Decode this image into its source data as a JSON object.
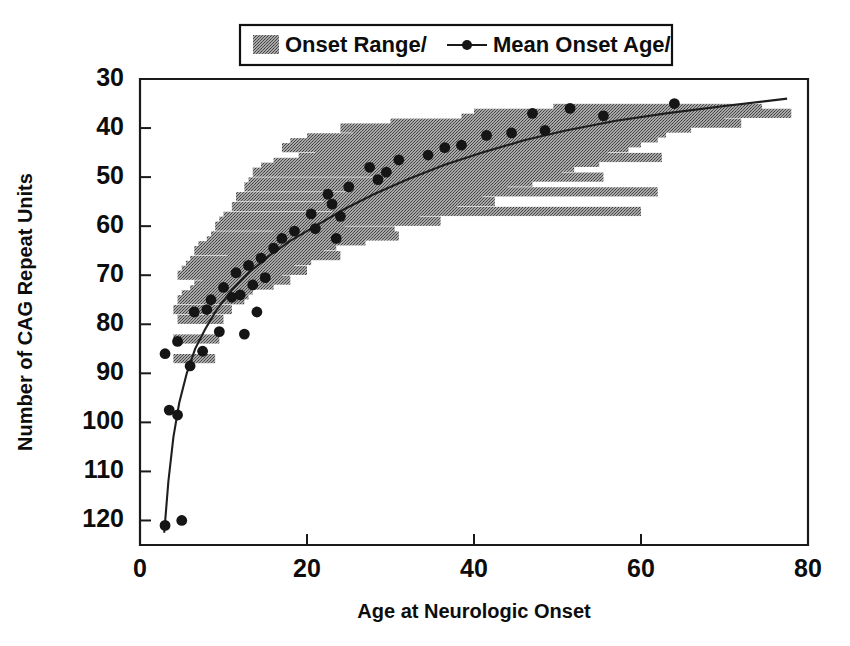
{
  "figure": {
    "legend": {
      "position": "top-center",
      "entries": [
        {
          "label": "Onset Range/",
          "marker": "gray-bar-swatch"
        },
        {
          "label": "Mean Onset Age/",
          "marker": "line-with-dot"
        }
      ]
    }
  },
  "chart_data": {
    "type": "scatter",
    "title": "",
    "subtitle": "",
    "xlabel": "Age at Neurologic Onset",
    "ylabel": "Number of CAG Repeat Units",
    "xlim": [
      0,
      80
    ],
    "ylim": [
      30,
      125
    ],
    "y_axis_inverted": true,
    "grid": false,
    "xticks": [
      0,
      20,
      40,
      60,
      80
    ],
    "xticklabels": [
      "0",
      "20",
      "40",
      "60",
      "80"
    ],
    "yticks": [
      30,
      40,
      50,
      60,
      70,
      80,
      90,
      100,
      110,
      120
    ],
    "yticklabels": [
      "30",
      "40",
      "50",
      "60",
      "70",
      "80",
      "90",
      "100",
      "110",
      "120"
    ],
    "legend_entries": [
      "Onset Range/",
      "Mean Onset Age/"
    ],
    "series": [
      {
        "name": "Onset Range/",
        "type": "hbar-range",
        "color": "#909090",
        "note": "Horizontal gray bars spanning min-to-max age of onset at each CAG repeat length",
        "ranges": [
          {
            "cag": 36,
            "xmin": 49.5,
            "xmax": 74.5
          },
          {
            "cag": 37,
            "xmin": 40.0,
            "xmax": 78.0
          },
          {
            "cag": 38,
            "xmin": 38.5,
            "xmax": 70.0
          },
          {
            "cag": 39,
            "xmin": 30.0,
            "xmax": 72.0
          },
          {
            "cag": 40,
            "xmin": 24.0,
            "xmax": 66.0
          },
          {
            "cag": 41,
            "xmin": 25.5,
            "xmax": 63.0
          },
          {
            "cag": 42,
            "xmin": 20.0,
            "xmax": 62.0
          },
          {
            "cag": 43,
            "xmin": 18.0,
            "xmax": 60.0
          },
          {
            "cag": 44,
            "xmin": 17.0,
            "xmax": 58.5
          },
          {
            "cag": 45,
            "xmin": 21.0,
            "xmax": 56.0
          },
          {
            "cag": 46,
            "xmin": 19.0,
            "xmax": 62.5
          },
          {
            "cag": 47,
            "xmin": 16.0,
            "xmax": 55.0
          },
          {
            "cag": 48,
            "xmin": 14.5,
            "xmax": 52.0
          },
          {
            "cag": 49,
            "xmin": 13.5,
            "xmax": 50.5
          },
          {
            "cag": 50,
            "xmin": 28.0,
            "xmax": 55.5
          },
          {
            "cag": 51,
            "xmin": 13.0,
            "xmax": 47.0
          },
          {
            "cag": 52,
            "xmin": 12.5,
            "xmax": 44.0
          },
          {
            "cag": 53,
            "xmin": 25.0,
            "xmax": 62.0
          },
          {
            "cag": 54,
            "xmin": 11.5,
            "xmax": 41.0
          },
          {
            "cag": 55,
            "xmin": 22.0,
            "xmax": 42.5
          },
          {
            "cag": 56,
            "xmin": 11.0,
            "xmax": 38.0
          },
          {
            "cag": 57,
            "xmin": 23.0,
            "xmax": 60.0
          },
          {
            "cag": 58,
            "xmin": 10.0,
            "xmax": 33.5
          },
          {
            "cag": 59,
            "xmin": 9.5,
            "xmax": 36.0
          },
          {
            "cag": 60,
            "xmin": 9.0,
            "xmax": 24.5
          },
          {
            "cag": 61,
            "xmin": 16.0,
            "xmax": 30.5
          },
          {
            "cag": 62,
            "xmin": 8.5,
            "xmax": 31.0
          },
          {
            "cag": 63,
            "xmin": 8.0,
            "xmax": 27.0
          },
          {
            "cag": 64,
            "xmin": 7.0,
            "xmax": 23.5
          },
          {
            "cag": 65,
            "xmin": 6.5,
            "xmax": 22.0
          },
          {
            "cag": 66,
            "xmin": 10.5,
            "xmax": 24.0
          },
          {
            "cag": 67,
            "xmin": 6.0,
            "xmax": 20.5
          },
          {
            "cag": 68,
            "xmin": 5.5,
            "xmax": 18.5
          },
          {
            "cag": 69,
            "xmin": 5.0,
            "xmax": 20.0
          },
          {
            "cag": 70,
            "xmin": 4.5,
            "xmax": 17.0
          },
          {
            "cag": 71,
            "xmin": 7.5,
            "xmax": 18.0
          },
          {
            "cag": 72,
            "xmin": 6.5,
            "xmax": 16.0
          },
          {
            "cag": 73,
            "xmin": 6.0,
            "xmax": 13.5
          },
          {
            "cag": 74,
            "xmin": 5.0,
            "xmax": 13.0
          },
          {
            "cag": 75,
            "xmin": 4.5,
            "xmax": 12.5
          },
          {
            "cag": 77,
            "xmin": 4.0,
            "xmax": 11.0
          },
          {
            "cag": 79,
            "xmin": 4.5,
            "xmax": 10.0
          },
          {
            "cag": 83,
            "xmin": 4.0,
            "xmax": 9.5
          },
          {
            "cag": 87,
            "xmin": 4.0,
            "xmax": 9.0
          }
        ]
      },
      {
        "name": "Mean Onset Age/",
        "type": "scatter-points",
        "color": "#151515",
        "points": [
          {
            "x": 64.0,
            "y": 35.0
          },
          {
            "x": 51.5,
            "y": 36.0
          },
          {
            "x": 55.5,
            "y": 37.5
          },
          {
            "x": 47.0,
            "y": 37.0
          },
          {
            "x": 48.5,
            "y": 40.5
          },
          {
            "x": 44.5,
            "y": 41.0
          },
          {
            "x": 41.5,
            "y": 41.5
          },
          {
            "x": 38.5,
            "y": 43.5
          },
          {
            "x": 36.5,
            "y": 44.0
          },
          {
            "x": 34.5,
            "y": 45.5
          },
          {
            "x": 31.0,
            "y": 46.5
          },
          {
            "x": 29.5,
            "y": 49.0
          },
          {
            "x": 28.5,
            "y": 50.5
          },
          {
            "x": 27.5,
            "y": 48.0
          },
          {
            "x": 25.0,
            "y": 52.0
          },
          {
            "x": 22.5,
            "y": 53.5
          },
          {
            "x": 23.0,
            "y": 55.5
          },
          {
            "x": 20.5,
            "y": 57.5
          },
          {
            "x": 24.0,
            "y": 58.0
          },
          {
            "x": 21.0,
            "y": 60.5
          },
          {
            "x": 18.5,
            "y": 61.0
          },
          {
            "x": 17.0,
            "y": 62.5
          },
          {
            "x": 23.5,
            "y": 62.5
          },
          {
            "x": 16.0,
            "y": 64.5
          },
          {
            "x": 14.5,
            "y": 66.5
          },
          {
            "x": 13.0,
            "y": 68.0
          },
          {
            "x": 11.5,
            "y": 69.5
          },
          {
            "x": 15.0,
            "y": 70.5
          },
          {
            "x": 13.5,
            "y": 72.0
          },
          {
            "x": 10.0,
            "y": 72.5
          },
          {
            "x": 11.0,
            "y": 74.5
          },
          {
            "x": 8.5,
            "y": 75.0
          },
          {
            "x": 12.0,
            "y": 74.0
          },
          {
            "x": 14.0,
            "y": 77.5
          },
          {
            "x": 8.0,
            "y": 77.0
          },
          {
            "x": 6.5,
            "y": 77.5
          },
          {
            "x": 9.5,
            "y": 81.5
          },
          {
            "x": 12.5,
            "y": 82.0
          },
          {
            "x": 4.5,
            "y": 83.5
          },
          {
            "x": 7.5,
            "y": 85.5
          },
          {
            "x": 3.0,
            "y": 86.0
          },
          {
            "x": 6.0,
            "y": 88.5
          },
          {
            "x": 3.5,
            "y": 97.5
          },
          {
            "x": 4.5,
            "y": 98.5
          },
          {
            "x": 3.0,
            "y": 121.0
          },
          {
            "x": 5.0,
            "y": 120.0
          }
        ]
      },
      {
        "name": "fitted-curve",
        "type": "line",
        "color": "#1e1e1e",
        "points": [
          {
            "x": 2.9,
            "y": 122.5
          },
          {
            "x": 3.4,
            "y": 112.0
          },
          {
            "x": 4.0,
            "y": 103.0
          },
          {
            "x": 4.7,
            "y": 96.0
          },
          {
            "x": 5.6,
            "y": 90.0
          },
          {
            "x": 6.6,
            "y": 85.0
          },
          {
            "x": 7.8,
            "y": 81.0
          },
          {
            "x": 9.2,
            "y": 77.0
          },
          {
            "x": 11.0,
            "y": 73.0
          },
          {
            "x": 13.0,
            "y": 69.5
          },
          {
            "x": 15.5,
            "y": 66.0
          },
          {
            "x": 18.0,
            "y": 63.0
          },
          {
            "x": 21.0,
            "y": 60.0
          },
          {
            "x": 24.5,
            "y": 56.5
          },
          {
            "x": 28.0,
            "y": 53.5
          },
          {
            "x": 32.0,
            "y": 50.5
          },
          {
            "x": 36.5,
            "y": 47.5
          },
          {
            "x": 41.0,
            "y": 45.0
          },
          {
            "x": 46.0,
            "y": 42.5
          },
          {
            "x": 51.0,
            "y": 40.5
          },
          {
            "x": 57.0,
            "y": 38.5
          },
          {
            "x": 63.0,
            "y": 37.0
          },
          {
            "x": 70.0,
            "y": 35.5
          },
          {
            "x": 77.5,
            "y": 34.0
          }
        ]
      }
    ]
  }
}
